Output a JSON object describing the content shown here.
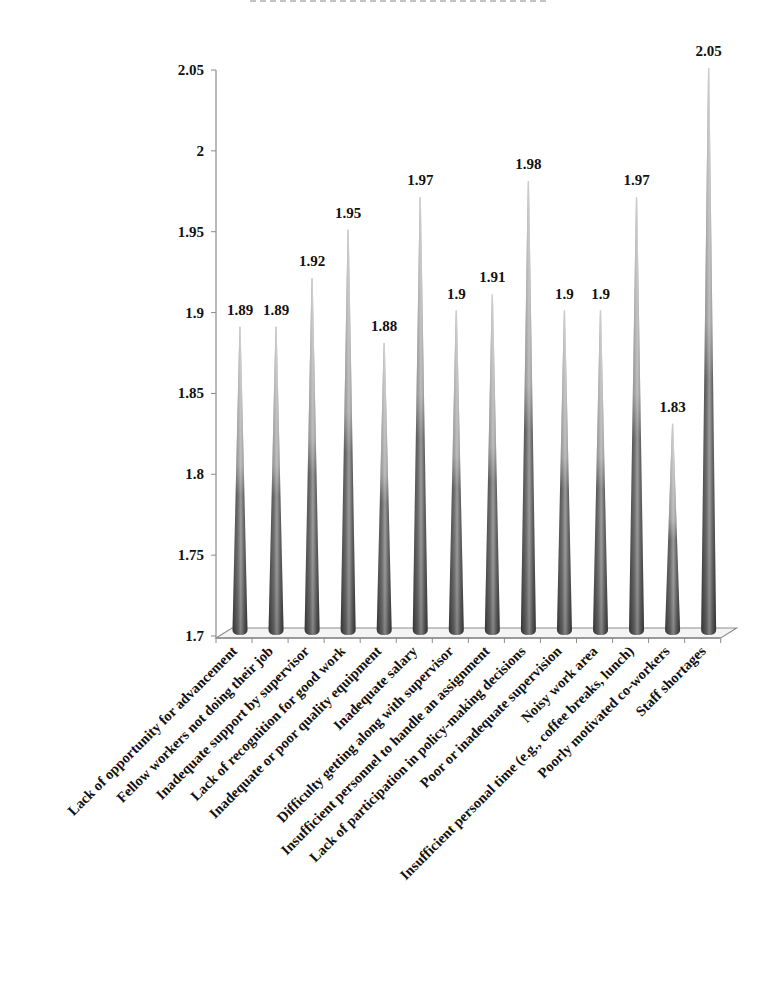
{
  "chart_data": {
    "type": "bar",
    "style": "3d-cone",
    "title": "",
    "xlabel": "",
    "ylabel": "",
    "ylim": [
      1.7,
      2.05
    ],
    "yticks": [
      "2.05",
      "2",
      "1.95",
      "1.9",
      "1.85",
      "1.8",
      "1.75",
      "1.7"
    ],
    "ytick_values": [
      2.05,
      2.0,
      1.95,
      1.9,
      1.85,
      1.8,
      1.75,
      1.7
    ],
    "grid": false,
    "legend": "none",
    "categories": [
      "Lack of opportunity for advancement",
      "Fellow workers not doing their job",
      "Inadequate support by supervisor",
      "Lack of recognition for good work",
      "Inadequate or poor quality equipment",
      "Inadequate salary",
      "Difficulty getting along with supervisor",
      "Insufficient personnel to handle an assignment",
      "Lack of participation in policy-making decisions",
      "Poor or inadequate supervision",
      "Noisy work area",
      "Insufficient personal time (e.g., coffee breaks, lunch)",
      "Poorly motivated co-workers",
      "Staff shortages"
    ],
    "values": [
      1.89,
      1.89,
      1.92,
      1.95,
      1.88,
      1.97,
      1.9,
      1.91,
      1.98,
      1.9,
      1.9,
      1.97,
      1.83,
      2.05
    ],
    "data_labels": [
      "1.89",
      "1.89",
      "1.92",
      "1.95",
      "1.88",
      "1.97",
      "1.9",
      "1.91",
      "1.98",
      "1.9",
      "1.9",
      "1.97",
      "1.83",
      "2.05"
    ],
    "colors": {
      "bar_dark": "#4a4a4a",
      "bar_mid": "#8a8a8a",
      "bar_light": "#d8d8d8",
      "axis": "#8c8c8c",
      "text": "#111111"
    }
  }
}
